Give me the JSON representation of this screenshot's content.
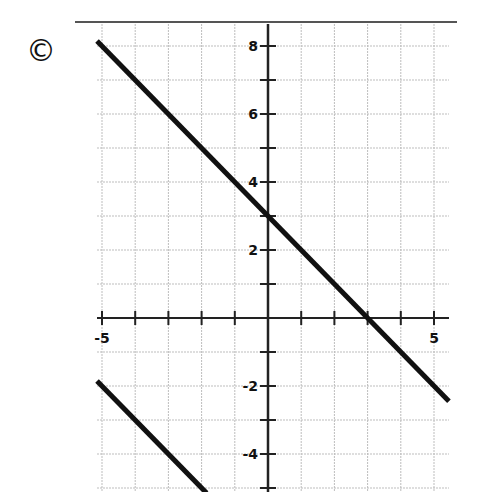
{
  "choice_label": "©",
  "chart_data": {
    "type": "line",
    "title": "",
    "xlabel": "",
    "ylabel": "",
    "xlim": [
      -5.15,
      5.45
    ],
    "ylim": [
      -5.2,
      8.7
    ],
    "grid": true,
    "x_tick_labels": [
      "-5",
      "5"
    ],
    "y_tick_labels": [
      "8",
      "6",
      "4",
      "2",
      "-2",
      "-4"
    ],
    "series": [
      {
        "name": "line-1",
        "equation": "y = -x + 3",
        "x": [
          -5.15,
          5.45
        ],
        "y": [
          8.15,
          -2.45
        ]
      },
      {
        "name": "line-2",
        "equation": "y = -x - 7",
        "x": [
          -5.15,
          -1.85
        ],
        "y": [
          -1.85,
          -5.15
        ]
      }
    ],
    "annotations": []
  },
  "colors": {
    "line": "#111111",
    "grid": "#bdbdbd",
    "axis": "#222222",
    "background": "#ffffff"
  }
}
